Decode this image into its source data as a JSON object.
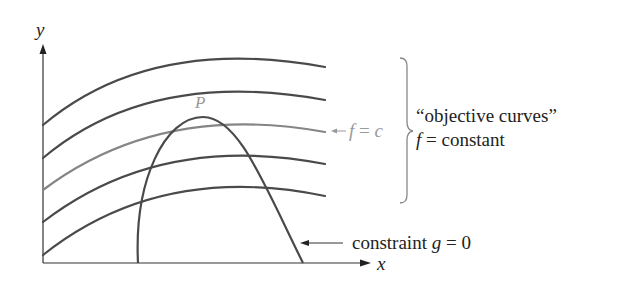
{
  "diagram": {
    "axes": {
      "x_label": "x",
      "y_label": "y"
    },
    "point_label": "P",
    "level_curve_label": {
      "arrow": "←",
      "f": "f",
      "eq": " = ",
      "c": "c"
    },
    "brace_label": {
      "line1": "“objective curves”",
      "line2_f": "f",
      "line2_rest": " = constant"
    },
    "constraint_label": {
      "text": "constraint ",
      "g": "g",
      "rest": " = 0"
    },
    "colors": {
      "curve": "#4a4a4a",
      "highlight_curve": "#8a8a8a",
      "axis": "#333333",
      "label_gray": "#999999",
      "text": "#222222"
    },
    "objective_curves": [
      {
        "name": "f1",
        "highlighted": false
      },
      {
        "name": "f2",
        "highlighted": false
      },
      {
        "name": "f = c",
        "highlighted": true
      },
      {
        "name": "f4",
        "highlighted": false
      },
      {
        "name": "f5",
        "highlighted": false
      }
    ]
  }
}
